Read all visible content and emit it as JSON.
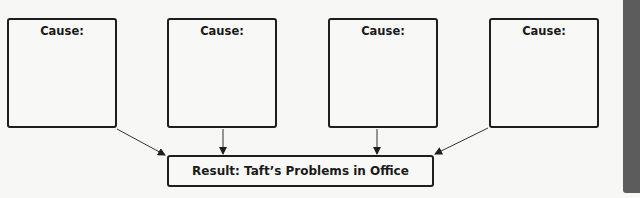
{
  "diagram": {
    "type": "cause-effect",
    "causes": [
      {
        "label": "Cause:",
        "content": ""
      },
      {
        "label": "Cause:",
        "content": ""
      },
      {
        "label": "Cause:",
        "content": ""
      },
      {
        "label": "Cause:",
        "content": ""
      }
    ],
    "result": {
      "label": "Result: Taft’s Problems in Office"
    },
    "colors": {
      "border": "#1e1e1e",
      "background": "#f7f7f5",
      "side_tab": "#5c5c5c"
    }
  }
}
